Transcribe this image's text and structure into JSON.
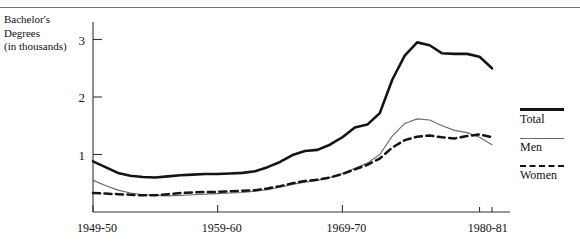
{
  "chart_data": {
    "type": "line",
    "title": "",
    "ylabel": "Bachelor's Degrees (in thousands)",
    "ylabel_lines": "Bachelor's\nDegrees\n(in thousands)",
    "xlabel": "",
    "ylim": [
      0,
      3.4
    ],
    "yticks": [
      1,
      2,
      3
    ],
    "ytick_labels": [
      "1",
      "2",
      "3"
    ],
    "xlim": [
      1949,
      1981
    ],
    "xticks": [
      1949,
      1959,
      1969,
      1980,
      1981
    ],
    "xtick_labels": [
      "1949-50",
      "1959-60",
      "1969-70",
      "1980-81"
    ],
    "grid": false,
    "legend_position": "right",
    "x": [
      1949,
      1950,
      1951,
      1952,
      1953,
      1954,
      1955,
      1956,
      1957,
      1958,
      1959,
      1960,
      1961,
      1962,
      1963,
      1964,
      1965,
      1966,
      1967,
      1968,
      1969,
      1970,
      1971,
      1972,
      1973,
      1974,
      1975,
      1976,
      1977,
      1978,
      1979,
      1980,
      1981
    ],
    "series": [
      {
        "name": "Total",
        "style": "thick-solid",
        "color": "#141414",
        "values": [
          0.88,
          0.78,
          0.68,
          0.63,
          0.61,
          0.6,
          0.62,
          0.64,
          0.65,
          0.66,
          0.66,
          0.67,
          0.68,
          0.71,
          0.78,
          0.87,
          0.99,
          1.06,
          1.08,
          1.17,
          1.3,
          1.47,
          1.52,
          1.72,
          2.3,
          2.72,
          2.95,
          2.9,
          2.76,
          2.75,
          2.75,
          2.7,
          2.5
        ]
      },
      {
        "name": "Men",
        "style": "thin-solid",
        "color": "#6b6b6b",
        "values": [
          0.55,
          0.46,
          0.38,
          0.33,
          0.3,
          0.29,
          0.28,
          0.29,
          0.3,
          0.31,
          0.32,
          0.33,
          0.34,
          0.36,
          0.39,
          0.43,
          0.48,
          0.52,
          0.55,
          0.6,
          0.67,
          0.76,
          0.85,
          1.0,
          1.32,
          1.54,
          1.62,
          1.6,
          1.5,
          1.42,
          1.38,
          1.3,
          1.17
        ]
      },
      {
        "name": "Women",
        "style": "dashed",
        "color": "#141414",
        "values": [
          0.33,
          0.32,
          0.31,
          0.3,
          0.29,
          0.29,
          0.31,
          0.33,
          0.34,
          0.35,
          0.35,
          0.36,
          0.37,
          0.38,
          0.41,
          0.45,
          0.5,
          0.54,
          0.56,
          0.6,
          0.66,
          0.74,
          0.82,
          0.93,
          1.12,
          1.25,
          1.31,
          1.33,
          1.3,
          1.28,
          1.32,
          1.35,
          1.3
        ]
      }
    ]
  }
}
